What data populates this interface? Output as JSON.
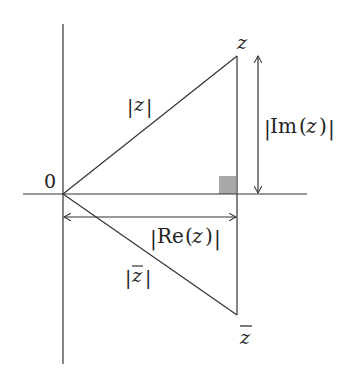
{
  "diagram": {
    "colors": {
      "line": "#333333",
      "right_angle_marker": "#a8a8a8",
      "background": "#ffffff"
    },
    "points": {
      "origin": {
        "label": "0",
        "x": 63,
        "y": 194
      },
      "z": {
        "label": "z",
        "x": 237,
        "y": 56
      },
      "z_conj": {
        "label": "z̄",
        "x": 237,
        "y": 315
      }
    },
    "axes": {
      "horizontal": {
        "x1": 23,
        "x2": 307,
        "y": 194
      },
      "vertical": {
        "x": 63,
        "y1": 24,
        "y2": 364
      }
    },
    "labels": {
      "origin": "0",
      "z": "z",
      "z_conj": "z",
      "abs_z": "|z|",
      "abs_z_conj": "|z̄|",
      "abs_im": "|Im(z)|",
      "abs_re": "|Re(z)|"
    },
    "label_parts": {
      "bar": "|",
      "z": "z",
      "im": "Im",
      "re": "Re",
      "lparen": "(",
      "rparen": ")"
    }
  }
}
